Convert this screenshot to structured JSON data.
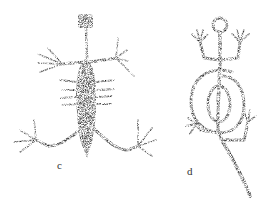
{
  "figures": [
    {
      "id": "c",
      "label": "c",
      "subject": "stippled lizard petroglyph with long limbs and spread digits"
    },
    {
      "id": "d",
      "label": "d",
      "subject": "stippled figure with ring head, raised limbs and concentric spiral body with long tail"
    }
  ],
  "colors": {
    "ink": "#1a1a1a",
    "background": "#ffffff"
  }
}
